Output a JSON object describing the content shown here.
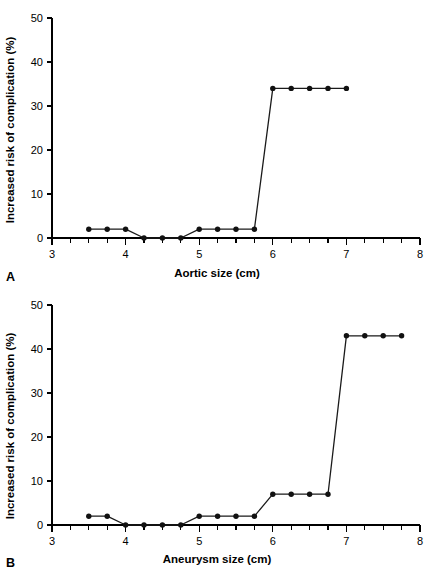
{
  "figure": {
    "background": "#ffffff",
    "ink_color": "#000000"
  },
  "panels": [
    {
      "letter": "A",
      "xlabel": "Aortic size (cm)",
      "ylabel": "Increased risk of complication (%)"
    },
    {
      "letter": "B",
      "xlabel": "Aneurysm size (cm)",
      "ylabel": "Increased risk of complication (%)"
    }
  ],
  "chart_data": [
    {
      "type": "line",
      "panel": "A",
      "title": "",
      "xlabel": "Aortic size (cm)",
      "ylabel": "Increased risk of complication (%)",
      "xlim": [
        3,
        8
      ],
      "ylim": [
        0,
        50
      ],
      "xticks": [
        3,
        4,
        5,
        6,
        7,
        8
      ],
      "xtick_labels": [
        "3",
        "4",
        "5",
        "6",
        "7",
        "8"
      ],
      "xminor_step": 0.25,
      "yticks": [
        0,
        10,
        20,
        30,
        40,
        50
      ],
      "ytick_labels": [
        "0",
        "10",
        "20",
        "30",
        "40",
        "50"
      ],
      "grid": false,
      "legend": false,
      "marker": "filled-circle",
      "x": [
        3.5,
        3.75,
        4.0,
        4.25,
        4.5,
        4.75,
        5.0,
        5.25,
        5.5,
        5.75,
        6.0,
        6.25,
        6.5,
        6.75,
        7.0
      ],
      "values": [
        2,
        2,
        2,
        0,
        0,
        0,
        2,
        2,
        2,
        2,
        34,
        34,
        34,
        34,
        34
      ]
    },
    {
      "type": "line",
      "panel": "B",
      "title": "",
      "xlabel": "Aneurysm size (cm)",
      "ylabel": "Increased risk of complication (%)",
      "xlim": [
        3,
        8
      ],
      "ylim": [
        0,
        50
      ],
      "xticks": [
        3,
        4,
        5,
        6,
        7,
        8
      ],
      "xtick_labels": [
        "3",
        "4",
        "5",
        "6",
        "7",
        "8"
      ],
      "xminor_step": 0.25,
      "yticks": [
        0,
        10,
        20,
        30,
        40,
        50
      ],
      "ytick_labels": [
        "0",
        "10",
        "20",
        "30",
        "40",
        "50"
      ],
      "grid": false,
      "legend": false,
      "marker": "filled-circle",
      "x": [
        3.5,
        3.75,
        4.0,
        4.25,
        4.5,
        4.75,
        5.0,
        5.25,
        5.5,
        5.75,
        6.0,
        6.25,
        6.5,
        6.75,
        7.0,
        7.25,
        7.5,
        7.75
      ],
      "values": [
        2,
        2,
        0,
        0,
        0,
        0,
        2,
        2,
        2,
        2,
        7,
        7,
        7,
        7,
        43,
        43,
        43,
        43
      ]
    }
  ]
}
